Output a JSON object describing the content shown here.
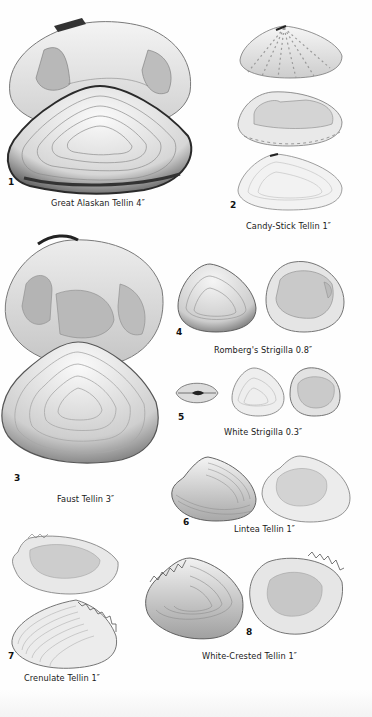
{
  "page": {
    "background": "#fefefe",
    "ink_color": "#1a1a1a",
    "shell_fill": "#e9e9e9",
    "shell_shadow": "#9a9a9a"
  },
  "plates": [
    {
      "number": "1",
      "name": "Great Alaskan Tellin",
      "size": "4″",
      "caption": "Great Alaskan Tellin 4″"
    },
    {
      "number": "2",
      "name": "Candy-Stick Tellin",
      "size": "1″",
      "caption": "Candy-Stick Tellin 1″"
    },
    {
      "number": "3",
      "name": "Faust Tellin",
      "size": "3″",
      "caption": "Faust Tellin 3″"
    },
    {
      "number": "4",
      "name": "Romberg's Strigilla",
      "size": "0.8″",
      "caption": "Romberg's Strigilla 0.8″"
    },
    {
      "number": "5",
      "name": "White Strigilla",
      "size": "0.3″",
      "caption": "White Strigilla 0.3″"
    },
    {
      "number": "6",
      "name": "Lintea Tellin",
      "size": "1″",
      "caption": "Lintea Tellin 1″"
    },
    {
      "number": "7",
      "name": "Crenulate Tellin",
      "size": "1″",
      "caption": "Crenulate Tellin 1″"
    },
    {
      "number": "8",
      "name": "White-Crested Tellin",
      "size": "1″",
      "caption": "White-Crested Tellin 1″"
    }
  ]
}
